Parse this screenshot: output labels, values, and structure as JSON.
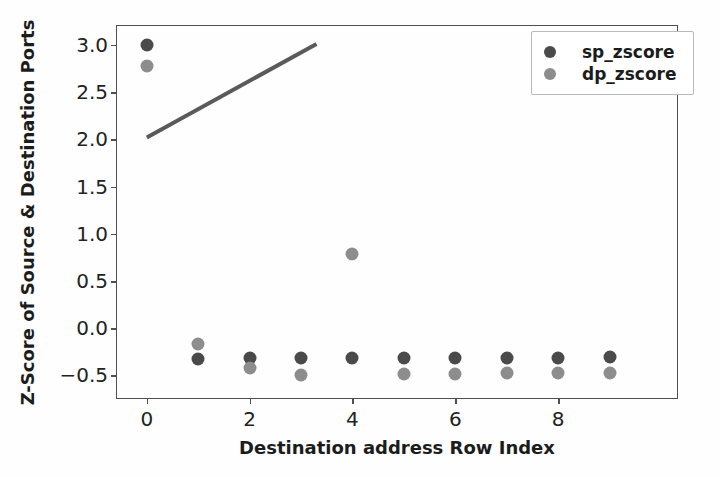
{
  "chart_data": {
    "type": "scatter",
    "title": "",
    "xlabel": "Destination address Row Index",
    "ylabel": "Z-Score of Source & Destination Ports",
    "xlim": [
      -0.58,
      10.35
    ],
    "ylim": [
      -0.76,
      3.2
    ],
    "xticks": [
      0,
      2,
      4,
      6,
      8
    ],
    "xtick_labels": [
      "0",
      "2",
      "4",
      "6",
      "8"
    ],
    "yticks": [
      3.0,
      2.5,
      2.0,
      1.5,
      1.0,
      0.5,
      0.0,
      -0.5
    ],
    "ytick_labels": [
      "3.0",
      "2.5",
      "2.0",
      "1.5",
      "1.0",
      "0.5",
      "0.0",
      "−0.5"
    ],
    "grid": false,
    "legend_position": "upper right",
    "x": [
      0,
      1,
      2,
      3,
      4,
      5,
      6,
      7,
      8,
      9
    ],
    "series": [
      {
        "name": "sp_zscore",
        "color": "#4a4a4a",
        "values": [
          3.0,
          -0.33,
          -0.32,
          -0.32,
          -0.32,
          -0.32,
          -0.32,
          -0.32,
          -0.31,
          -0.3
        ]
      },
      {
        "name": "dp_zscore",
        "color": "#8d8d8d",
        "values": [
          2.78,
          -0.17,
          -0.42,
          -0.49,
          0.79,
          -0.48,
          -0.48,
          -0.47,
          -0.47,
          -0.47
        ]
      }
    ],
    "annotations": [
      {
        "type": "line",
        "name": "trend-line",
        "color": "#5a5a5a",
        "x0": 0.0,
        "y0": 2.02,
        "x1": 3.3,
        "y1": 3.01
      }
    ]
  },
  "legend": {
    "entries": [
      {
        "label": "sp_zscore",
        "color": "#4a4a4a"
      },
      {
        "label": "dp_zscore",
        "color": "#8d8d8d"
      }
    ]
  }
}
